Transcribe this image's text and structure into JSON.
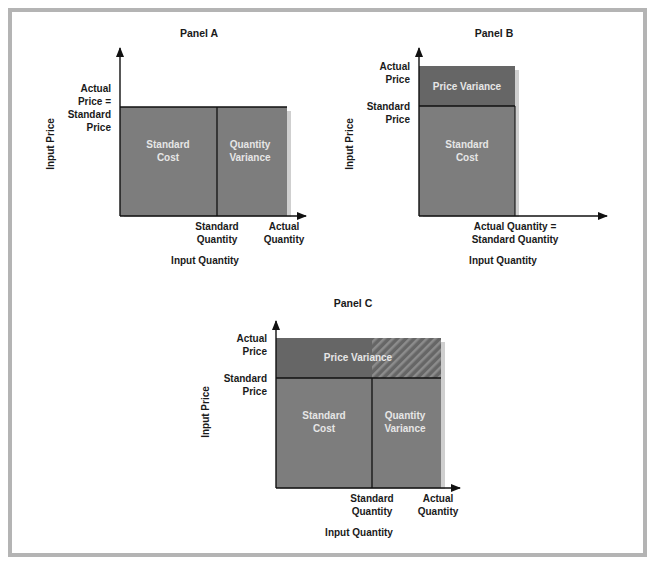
{
  "colors": {
    "frame": "#b4b4b4",
    "standard_cost_fill": "#7d7d7d",
    "variance_fill": "#7d7d7d",
    "price_variance_fill": "#666666",
    "shadow": "#c8c8c8",
    "axis": "#111111",
    "label_on_fill": "#e6e6e6"
  },
  "panels": {
    "a": {
      "title": "Panel A",
      "y_axis_label": "Input Price",
      "x_axis_label": "Input Quantity",
      "y_tick": [
        "Actual",
        "Price =",
        "Standard",
        "Price"
      ],
      "x_ticks": {
        "standard": [
          "Standard",
          "Quantity"
        ],
        "actual": [
          "Actual",
          "Quantity"
        ]
      },
      "regions": {
        "standard_cost": [
          "Standard",
          "Cost"
        ],
        "quantity_variance": [
          "Quantity",
          "Variance"
        ]
      }
    },
    "b": {
      "title": "Panel B",
      "y_axis_label": "Input Price",
      "x_axis_label": "Input Quantity",
      "y_ticks": {
        "actual": [
          "Actual",
          "Price"
        ],
        "standard": [
          "Standard",
          "Price"
        ]
      },
      "x_tick": [
        "Actual Quantity =",
        "Standard Quantity"
      ],
      "regions": {
        "price_variance": "Price Variance",
        "standard_cost": [
          "Standard",
          "Cost"
        ]
      }
    },
    "c": {
      "title": "Panel C",
      "y_axis_label": "Input Price",
      "x_axis_label": "Input Quantity",
      "y_ticks": {
        "actual": [
          "Actual",
          "Price"
        ],
        "standard": [
          "Standard",
          "Price"
        ]
      },
      "x_ticks": {
        "standard": [
          "Standard",
          "Quantity"
        ],
        "actual": [
          "Actual",
          "Quantity"
        ]
      },
      "regions": {
        "price_variance": "Price Variance",
        "standard_cost": [
          "Standard",
          "Cost"
        ],
        "quantity_variance": [
          "Quantity",
          "Variance"
        ]
      }
    }
  }
}
